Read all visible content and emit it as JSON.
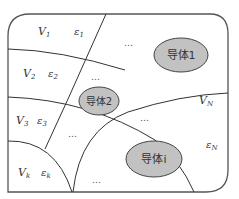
{
  "diagram": {
    "type": "region-partition",
    "colors": {
      "frame": "#555555",
      "line": "#333333",
      "conductor_fill": "#c2c2c2",
      "conductor_stroke": "#444444"
    },
    "regions": [
      {
        "volume": "V",
        "volume_sub": "1",
        "eps": "ε",
        "eps_sub": "1"
      },
      {
        "volume": "V",
        "volume_sub": "2",
        "eps": "ε",
        "eps_sub": "2"
      },
      {
        "volume": "V",
        "volume_sub": "3",
        "eps": "ε",
        "eps_sub": "3"
      },
      {
        "volume": "V",
        "volume_sub": "k",
        "eps": "ε",
        "eps_sub": "k"
      },
      {
        "volume": "V",
        "volume_sub": "N",
        "eps": "ε",
        "eps_sub": "N"
      }
    ],
    "conductors": [
      {
        "label": "导体1"
      },
      {
        "label": "导体2"
      },
      {
        "label": "导体i"
      }
    ],
    "ellipsis": "…"
  }
}
